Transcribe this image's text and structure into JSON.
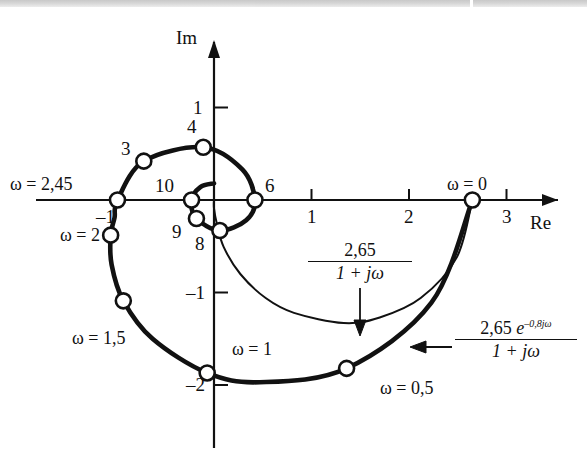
{
  "figure": {
    "kind": "nyquist-plot",
    "background": "#ffffff",
    "ink": "#111111",
    "scan_artifact_top": true
  },
  "axes": {
    "real_axis_label": "Re",
    "imag_axis_label": "Im",
    "origin_px": {
      "x": 214,
      "y": 200
    },
    "px_per_unit_x": 97.5,
    "px_per_unit_y": 92.5,
    "xlim": [
      -1.35,
      3.55
    ],
    "ylim": [
      -2.6,
      1.55
    ],
    "x_ticks": [
      {
        "value": -1,
        "label": "–1"
      },
      {
        "value": 1,
        "label": "1"
      },
      {
        "value": 2,
        "label": "2"
      },
      {
        "value": 3,
        "label": "3"
      }
    ],
    "y_ticks": [
      {
        "value": 1,
        "label": "1"
      },
      {
        "value": -1,
        "label": "–1"
      },
      {
        "value": -2,
        "label": "–2"
      }
    ]
  },
  "chart_data": {
    "type": "line",
    "title": "",
    "xlabel": "Re",
    "ylabel": "Im",
    "xlim": [
      -1.35,
      3.55
    ],
    "ylim": [
      -2.6,
      1.55
    ],
    "grid": false,
    "legend": "annotations",
    "series": [
      {
        "name": "2,65 e^{-0,8 jω} / (1 + jω)",
        "style": "thick",
        "description": "Nyquist locus of delayed first-order system; spirals inward to the origin",
        "K": 2.65,
        "delay": 0.8,
        "pole": 1.0,
        "points": [
          {
            "omega": 0.0,
            "re": 2.65,
            "im": 0.0
          },
          {
            "omega": 0.25,
            "re": 2.23,
            "im": -1.11
          },
          {
            "omega": 0.5,
            "re": 1.36,
            "im": -1.82
          },
          {
            "omega": 0.75,
            "re": 0.47,
            "im": -1.97
          },
          {
            "omega": 1.0,
            "re": -0.07,
            "im": -1.87
          },
          {
            "omega": 1.25,
            "re": -0.63,
            "im": -1.5
          },
          {
            "omega": 1.5,
            "re": -0.93,
            "im": -1.09
          },
          {
            "omega": 1.75,
            "re": -1.05,
            "im": -0.7
          },
          {
            "omega": 2.0,
            "re": -1.06,
            "im": -0.38
          },
          {
            "omega": 2.2,
            "re": -1.02,
            "im": -0.19
          },
          {
            "omega": 2.45,
            "re": -0.99,
            "im": 0.0
          },
          {
            "omega": 3.0,
            "re": -0.72,
            "im": 0.42
          },
          {
            "omega": 4.0,
            "re": -0.11,
            "im": 0.57
          },
          {
            "omega": 5.0,
            "re": 0.29,
            "im": 0.33
          },
          {
            "omega": 6.0,
            "re": 0.42,
            "im": 0.0
          },
          {
            "omega": 7.0,
            "re": 0.33,
            "im": -0.22
          },
          {
            "omega": 8.0,
            "re": 0.06,
            "im": -0.33
          },
          {
            "omega": 9.0,
            "re": -0.18,
            "im": -0.2
          },
          {
            "omega": 10.0,
            "re": -0.23,
            "im": 0.0
          },
          {
            "omega": 11.0,
            "re": -0.14,
            "im": 0.14
          },
          {
            "omega": 12.0,
            "re": 0.0,
            "im": 0.18
          }
        ],
        "markers": [
          {
            "id": "w0",
            "re": 2.65,
            "im": 0.0,
            "label": "ω = 0"
          },
          {
            "id": "w05",
            "re": 1.36,
            "im": -1.82,
            "label": "ω = 0,5"
          },
          {
            "id": "w1",
            "re": -0.07,
            "im": -1.87,
            "label": "ω = 1"
          },
          {
            "id": "w15",
            "re": -0.93,
            "im": -1.09,
            "label": "ω = 1,5"
          },
          {
            "id": "w2",
            "re": -1.06,
            "im": -0.38,
            "label": "ω = 2"
          },
          {
            "id": "w245",
            "re": -0.99,
            "im": 0.0,
            "label": "ω = 2,45"
          },
          {
            "id": "w3",
            "re": -0.72,
            "im": 0.42,
            "label": "3"
          },
          {
            "id": "w4",
            "re": -0.11,
            "im": 0.57,
            "label": "4"
          },
          {
            "id": "w6",
            "re": 0.42,
            "im": 0.0,
            "label": "6"
          },
          {
            "id": "w8",
            "re": 0.06,
            "im": -0.33,
            "label": "8"
          },
          {
            "id": "w9",
            "re": -0.18,
            "im": -0.2,
            "label": "9"
          },
          {
            "id": "w10",
            "re": -0.23,
            "im": 0.0,
            "label": "10"
          }
        ]
      },
      {
        "name": "2,65 / (1 + jω)",
        "style": "thin",
        "description": "Undelayed first-order Nyquist locus: semicircle from 2,65 to the origin",
        "K": 2.65,
        "pole": 1.0,
        "points": [
          {
            "omega": 0.0,
            "re": 2.65,
            "im": 0.0
          },
          {
            "omega": 0.25,
            "re": 2.49,
            "im": -0.62
          },
          {
            "omega": 0.5,
            "re": 2.12,
            "im": -1.06
          },
          {
            "omega": 0.75,
            "re": 1.7,
            "im": -1.27
          },
          {
            "omega": 1.0,
            "re": 1.33,
            "im": -1.33
          },
          {
            "omega": 1.5,
            "re": 0.82,
            "im": -1.22
          },
          {
            "omega": 2.0,
            "re": 0.53,
            "im": -1.06
          },
          {
            "omega": 3.0,
            "re": 0.27,
            "im": -0.8
          },
          {
            "omega": 5.0,
            "re": 0.1,
            "im": -0.51
          },
          {
            "omega": 10.0,
            "re": 0.03,
            "im": -0.26
          },
          {
            "omega": 30.0,
            "re": 0.0,
            "im": -0.09
          },
          {
            "omega": 200,
            "re": 0.0,
            "im": 0.0
          }
        ],
        "markers": []
      }
    ]
  },
  "annotations": {
    "formula_thin": {
      "numerator": "2,65",
      "denominator": "1 + jω",
      "arrow": "down",
      "target_series": "2,65 / (1 + jω)"
    },
    "formula_thick": {
      "numerator_base": "2,65",
      "numerator_exp_base": "e",
      "numerator_exp": "–0,8jω",
      "denominator": "1 + jω",
      "arrow": "left",
      "target_series": "2,65 e^{-0,8 jω} / (1 + jω)"
    }
  }
}
